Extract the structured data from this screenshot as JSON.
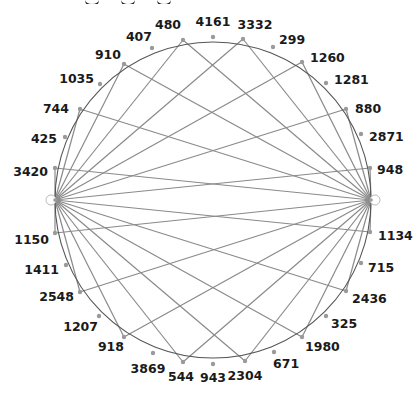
{
  "diagram": {
    "type": "circular-bipartite-graph",
    "heading_partial": "",
    "colors": {
      "edge": "#8a8a8a",
      "circle": "#555555",
      "node_fill": "#9a9a9a",
      "label": "#1a1a1a",
      "background": "#ffffff"
    },
    "circle": {
      "cx": 213,
      "cy": 200,
      "r": 158
    },
    "hubs": [
      {
        "id": "hub-left",
        "x": 55,
        "y": 200
      },
      {
        "id": "hub-right",
        "x": 371,
        "y": 200
      }
    ],
    "nodes": [
      {
        "label": "480",
        "x": 183,
        "y": 40,
        "lx": 168,
        "ly": 29,
        "anchor": "middle",
        "connected": true
      },
      {
        "label": "4161",
        "x": 213,
        "y": 37,
        "lx": 213,
        "ly": 26,
        "anchor": "middle",
        "connected": false
      },
      {
        "label": "3332",
        "x": 243,
        "y": 39,
        "lx": 255,
        "ly": 29,
        "anchor": "middle",
        "connected": true
      },
      {
        "label": "299",
        "x": 273,
        "y": 47,
        "lx": 279,
        "ly": 44,
        "anchor": "start",
        "connected": false
      },
      {
        "label": "1260",
        "x": 302,
        "y": 62,
        "lx": 310,
        "ly": 62,
        "anchor": "start",
        "connected": true
      },
      {
        "label": "1281",
        "x": 326,
        "y": 83,
        "lx": 334,
        "ly": 84,
        "anchor": "start",
        "connected": false
      },
      {
        "label": "880",
        "x": 346,
        "y": 109,
        "lx": 355,
        "ly": 113,
        "anchor": "start",
        "connected": true
      },
      {
        "label": "2871",
        "x": 361,
        "y": 134,
        "lx": 369,
        "ly": 141,
        "anchor": "start",
        "connected": false
      },
      {
        "label": "948",
        "x": 370,
        "y": 168,
        "lx": 377,
        "ly": 174,
        "anchor": "start",
        "connected": true
      },
      {
        "label": "1134",
        "x": 370,
        "y": 232,
        "lx": 378,
        "ly": 240,
        "anchor": "start",
        "connected": true
      },
      {
        "label": "715",
        "x": 361,
        "y": 263,
        "lx": 368,
        "ly": 272,
        "anchor": "start",
        "connected": false
      },
      {
        "label": "2436",
        "x": 346,
        "y": 291,
        "lx": 352,
        "ly": 303,
        "anchor": "start",
        "connected": true
      },
      {
        "label": "325",
        "x": 326,
        "y": 316,
        "lx": 331,
        "ly": 328,
        "anchor": "start",
        "connected": false
      },
      {
        "label": "1980",
        "x": 302,
        "y": 337,
        "lx": 305,
        "ly": 351,
        "anchor": "start",
        "connected": true
      },
      {
        "label": "671",
        "x": 274,
        "y": 352,
        "lx": 273,
        "ly": 368,
        "anchor": "start",
        "connected": false
      },
      {
        "label": "2304",
        "x": 245,
        "y": 361,
        "lx": 245,
        "ly": 380,
        "anchor": "middle",
        "connected": true
      },
      {
        "label": "943",
        "x": 213,
        "y": 364,
        "lx": 213,
        "ly": 382,
        "anchor": "middle",
        "connected": false
      },
      {
        "label": "544",
        "x": 183,
        "y": 362,
        "lx": 181,
        "ly": 381,
        "anchor": "middle",
        "connected": true
      },
      {
        "label": "3869",
        "x": 153,
        "y": 353,
        "lx": 148,
        "ly": 373,
        "anchor": "middle",
        "connected": false
      },
      {
        "label": "918",
        "x": 124,
        "y": 337,
        "lx": 124,
        "ly": 351,
        "anchor": "end",
        "connected": true
      },
      {
        "label": "1207",
        "x": 99,
        "y": 316,
        "lx": 98,
        "ly": 331,
        "anchor": "end",
        "connected": false
      },
      {
        "label": "2548",
        "x": 80,
        "y": 292,
        "lx": 74,
        "ly": 301,
        "anchor": "end",
        "connected": true
      },
      {
        "label": "1411",
        "x": 66,
        "y": 265,
        "lx": 59,
        "ly": 274,
        "anchor": "end",
        "connected": false
      },
      {
        "label": "1150",
        "x": 55,
        "y": 233,
        "lx": 49,
        "ly": 244,
        "anchor": "end",
        "connected": true
      },
      {
        "label": "3420",
        "x": 55,
        "y": 168,
        "lx": 48,
        "ly": 176,
        "anchor": "end",
        "connected": true
      },
      {
        "label": "425",
        "x": 65,
        "y": 137,
        "lx": 57,
        "ly": 143,
        "anchor": "end",
        "connected": false
      },
      {
        "label": "744",
        "x": 80,
        "y": 109,
        "lx": 69,
        "ly": 113,
        "anchor": "end",
        "connected": true
      },
      {
        "label": "1035",
        "x": 100,
        "y": 84,
        "lx": 94,
        "ly": 83,
        "anchor": "end",
        "connected": false
      },
      {
        "label": "910",
        "x": 124,
        "y": 64,
        "lx": 121,
        "ly": 59,
        "anchor": "end",
        "connected": true
      },
      {
        "label": "407",
        "x": 152,
        "y": 48,
        "lx": 152,
        "ly": 41,
        "anchor": "end",
        "connected": false
      }
    ]
  }
}
